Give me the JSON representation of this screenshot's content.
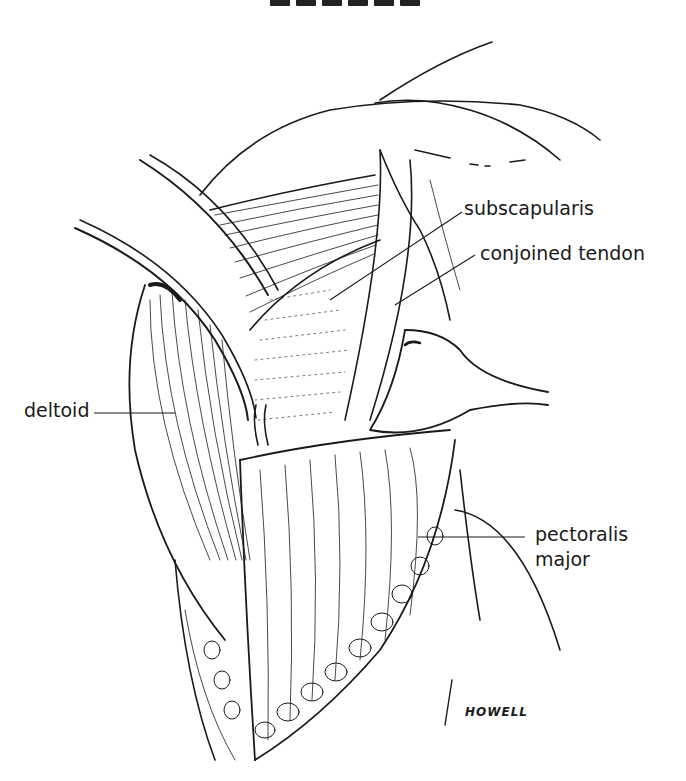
{
  "figure": {
    "labels": {
      "subscapularis": "subscapularis",
      "conjoined_tendon": "conjoined tendon",
      "deltoid": "deltoid",
      "pectoralis_major_line1": "pectoralis",
      "pectoralis_major_line2": "major"
    },
    "signature": "HOWELL",
    "colors": {
      "ink": "#1a1a1a",
      "background": "#ffffff"
    }
  }
}
